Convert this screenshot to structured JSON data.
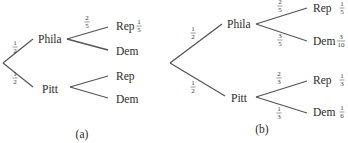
{
  "diagrams": [
    {
      "id": "a",
      "caption": "(a)",
      "root_branches": [
        {
          "node": "Phila",
          "prob": {
            "num": "1",
            "den": "2"
          },
          "children": [
            {
              "node": "Rep",
              "prob": {
                "num": "2",
                "den": "5"
              },
              "joint": {
                "num": "1",
                "den": "5"
              }
            },
            {
              "node": "Dem",
              "prob": null,
              "joint": null
            }
          ]
        },
        {
          "node": "Pitt",
          "prob": {
            "num": "1",
            "den": "2"
          },
          "children": [
            {
              "node": "Rep",
              "prob": null,
              "joint": null
            },
            {
              "node": "Dem",
              "prob": null,
              "joint": null
            }
          ]
        }
      ]
    },
    {
      "id": "b",
      "caption": "(b)",
      "root_branches": [
        {
          "node": "Phila",
          "prob": {
            "num": "1",
            "den": "2"
          },
          "children": [
            {
              "node": "Rep",
              "prob": {
                "num": "2",
                "den": "5"
              },
              "joint": {
                "num": "1",
                "den": "5"
              }
            },
            {
              "node": "Dem",
              "prob": {
                "num": "3",
                "den": "5"
              },
              "joint": {
                "num": "3",
                "den": "10"
              }
            }
          ]
        },
        {
          "node": "Pitt",
          "prob": {
            "num": "1",
            "den": "2"
          },
          "children": [
            {
              "node": "Rep",
              "prob": {
                "num": "2",
                "den": "3"
              },
              "joint": {
                "num": "1",
                "den": "3"
              }
            },
            {
              "node": "Dem",
              "prob": {
                "num": "1",
                "den": "3"
              },
              "joint": {
                "num": "1",
                "den": "6"
              }
            }
          ]
        }
      ]
    }
  ]
}
